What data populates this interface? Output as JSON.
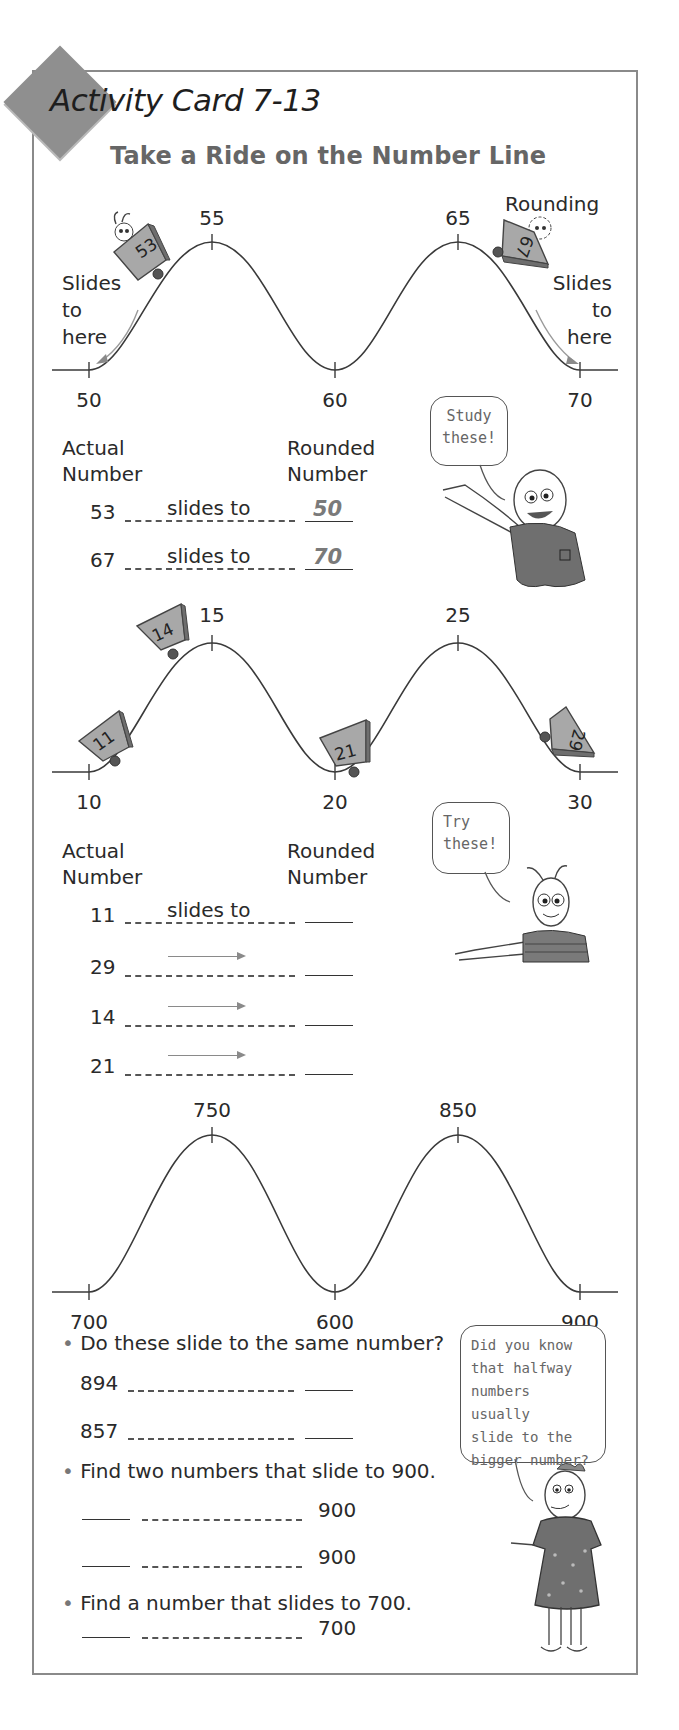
{
  "header": {
    "card_code": "Activity Card 7-13",
    "title": "Take a Ride on the Number Line"
  },
  "section1": {
    "corner_label": "Rounding",
    "left_note": [
      "Slides",
      "to",
      "here"
    ],
    "right_note": [
      "Slides",
      "to",
      "here"
    ],
    "top_ticks": [
      "55",
      "65"
    ],
    "bottom_ticks": [
      "50",
      "60",
      "70"
    ],
    "carts": [
      "53",
      "67"
    ],
    "col_actual": [
      "Actual",
      "Number"
    ],
    "col_rounded": [
      "Rounded",
      "Number"
    ],
    "bubble": [
      "Study",
      "these!"
    ],
    "rows": [
      {
        "actual": "53",
        "connector": "slides to",
        "rounded": "50"
      },
      {
        "actual": "67",
        "connector": "slides to",
        "rounded": "70"
      }
    ]
  },
  "section2": {
    "top_ticks": [
      "15",
      "25"
    ],
    "bottom_ticks": [
      "10",
      "20",
      "30"
    ],
    "carts": [
      "11",
      "14",
      "21",
      "29"
    ],
    "col_actual": [
      "Actual",
      "Number"
    ],
    "col_rounded": [
      "Rounded",
      "Number"
    ],
    "bubble": [
      "Try",
      "these!"
    ],
    "rows": [
      {
        "actual": "11",
        "connector": "slides to",
        "rounded": ""
      },
      {
        "actual": "29",
        "connector": "arrow",
        "rounded": ""
      },
      {
        "actual": "14",
        "connector": "arrow",
        "rounded": ""
      },
      {
        "actual": "21",
        "connector": "arrow",
        "rounded": ""
      }
    ]
  },
  "section3": {
    "top_ticks": [
      "750",
      "850"
    ],
    "bottom_ticks": [
      "700",
      "600",
      "900"
    ],
    "questions": [
      {
        "prompt": "Do these slide to the same number?",
        "rows": [
          {
            "left": "894",
            "right": ""
          },
          {
            "left": "857",
            "right": ""
          }
        ]
      },
      {
        "prompt": "Find two numbers that slide to 900.",
        "rows": [
          {
            "left": "",
            "right": "900"
          },
          {
            "left": "",
            "right": "900"
          }
        ]
      },
      {
        "prompt": "Find a number that slides to 700.",
        "rows": [
          {
            "left": "",
            "right": "700"
          }
        ]
      }
    ],
    "bubble": [
      "Did you know",
      "that halfway",
      "numbers usually",
      "slide to the",
      "bigger number?"
    ]
  },
  "colors": {
    "border": "#8a8a8a",
    "diamond": "#8f8f8f",
    "title": "#666666",
    "cart": "#a8a8a8",
    "character_fill": "#6f6f6f"
  }
}
